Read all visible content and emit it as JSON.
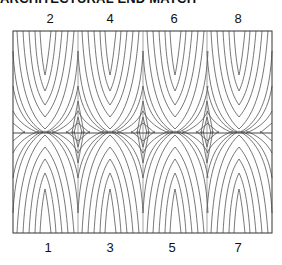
{
  "title": "ARCHITECTURAL END MATCH",
  "frame": {
    "x": 13,
    "y": 31,
    "width": 259,
    "height": 202,
    "midline_y": 133,
    "stroke": "#333333"
  },
  "grain_color": "#555555",
  "columns": 4,
  "top_labels": [
    {
      "text": "2",
      "x": 50
    },
    {
      "text": "4",
      "x": 110
    },
    {
      "text": "6",
      "x": 174
    },
    {
      "text": "8",
      "x": 238
    }
  ],
  "bottom_labels": [
    {
      "text": "1",
      "x": 48
    },
    {
      "text": "3",
      "x": 110
    },
    {
      "text": "5",
      "x": 172
    },
    {
      "text": "7",
      "x": 238
    }
  ]
}
